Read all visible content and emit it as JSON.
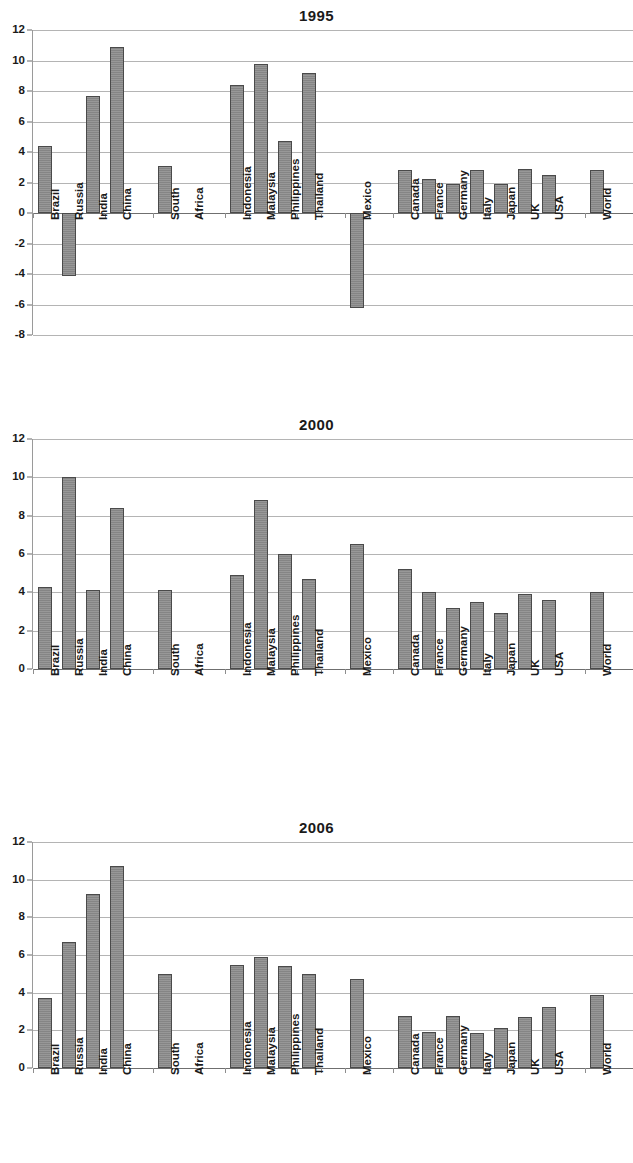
{
  "figure": {
    "categories": [
      "Brazil",
      "Russia",
      "India",
      "China",
      "South",
      "Africa",
      "Indonesia",
      "Malaysia",
      "Philippines",
      "Thailand",
      "Mexico",
      "Canada",
      "France",
      "Germany",
      "Italy",
      "Japan",
      "UK",
      "USA",
      "World"
    ]
  },
  "chart_data": [
    {
      "type": "bar",
      "title": "1995",
      "xlabel": "",
      "ylabel": "",
      "ylim": [
        -8,
        12
      ],
      "yticks": [
        12,
        10,
        8,
        6,
        4,
        2,
        0,
        -2,
        -4,
        -6,
        -8
      ],
      "grid": true,
      "legend": "none",
      "categories": [
        "Brazil",
        "Russia",
        "India",
        "China",
        "South Africa",
        "Indonesia",
        "Malaysia",
        "Philippines",
        "Thailand",
        "Mexico",
        "Canada",
        "France",
        "Germany",
        "Italy",
        "Japan",
        "UK",
        "USA",
        "World"
      ],
      "values": [
        4.4,
        -4.1,
        7.7,
        10.9,
        3.1,
        8.4,
        9.8,
        4.7,
        9.2,
        -6.2,
        2.8,
        2.2,
        1.9,
        2.8,
        1.9,
        2.9,
        2.5,
        2.8
      ]
    },
    {
      "type": "bar",
      "title": "2000",
      "xlabel": "",
      "ylabel": "",
      "ylim": [
        0,
        12
      ],
      "yticks": [
        12,
        10,
        8,
        6,
        4,
        2,
        0
      ],
      "grid": true,
      "legend": "none",
      "categories": [
        "Brazil",
        "Russia",
        "India",
        "China",
        "South Africa",
        "Indonesia",
        "Malaysia",
        "Philippines",
        "Thailand",
        "Mexico",
        "Canada",
        "France",
        "Germany",
        "Italy",
        "Japan",
        "UK",
        "USA",
        "World"
      ],
      "values": [
        4.3,
        10.0,
        4.1,
        8.4,
        4.1,
        4.9,
        8.8,
        6.0,
        4.7,
        6.5,
        5.2,
        4.0,
        3.2,
        3.5,
        2.9,
        3.9,
        3.6,
        4.0
      ]
    },
    {
      "type": "bar",
      "title": "2006",
      "xlabel": "",
      "ylabel": "",
      "ylim": [
        0,
        12
      ],
      "yticks": [
        12,
        10,
        8,
        6,
        4,
        2,
        0
      ],
      "grid": true,
      "legend": "none",
      "categories": [
        "Brazil",
        "Russia",
        "India",
        "China",
        "South Africa",
        "Indonesia",
        "Malaysia",
        "Philippines",
        "Thailand",
        "Mexico",
        "Canada",
        "France",
        "Germany",
        "Italy",
        "Japan",
        "UK",
        "USA",
        "World"
      ],
      "values": [
        3.7,
        6.7,
        9.25,
        10.7,
        5.0,
        5.45,
        5.9,
        5.4,
        5.0,
        4.7,
        2.75,
        1.9,
        2.75,
        1.85,
        2.15,
        2.7,
        3.25,
        3.85
      ]
    }
  ],
  "charts": [
    {
      "title": "1995"
    },
    {
      "title": "2000"
    },
    {
      "title": "2006"
    }
  ]
}
